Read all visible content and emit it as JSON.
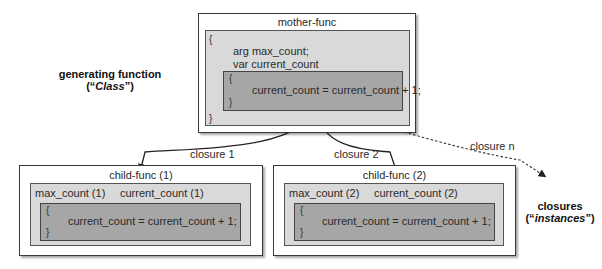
{
  "mother": {
    "title": "mother-func",
    "open_brace": "{",
    "close_brace": "}",
    "line1": "arg max_count;",
    "line2": "var current_count",
    "inner_open": "{",
    "inner_code": "current_count = current_count + 1;",
    "inner_close": "}"
  },
  "left_label": {
    "line1": "generating function",
    "line2_prefix": "(“",
    "line2_italic": "Class",
    "line2_suffix": "”)"
  },
  "right_label": {
    "line1": "closures",
    "line2_prefix": "(“",
    "line2_italic": "instances",
    "line2_suffix": "”)"
  },
  "arrows": {
    "closure1": "closure 1",
    "closure2": "closure 2",
    "closuren": "closure n"
  },
  "children": [
    {
      "title": "child-func (1)",
      "var1": "max_count (1)",
      "var2": "current_count (1)",
      "open": "{",
      "code": "current_count = current_count + 1;",
      "close": "}"
    },
    {
      "title": "child-func (2)",
      "var1": "max_count (2)",
      "var2": "current_count (2)",
      "open": "{",
      "code": "current_count = current_count + 1;",
      "close": "}"
    }
  ],
  "colors": {
    "light_fill": "#d9d9d9",
    "dark_fill": "#a6a6a6",
    "border": "#3a3a3a"
  }
}
